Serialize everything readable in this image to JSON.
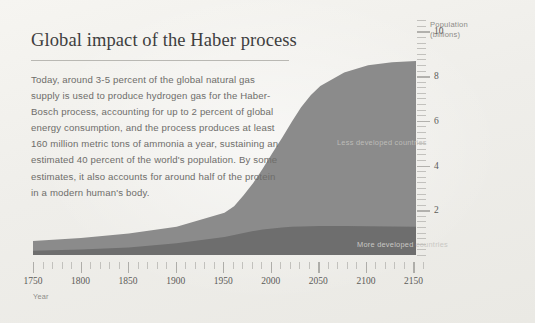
{
  "page": {
    "background": "#f2f1ed",
    "title": "Global impact of the Haber process",
    "body": "Today, around 3-5 percent of the global natural gas supply is used to produce hydrogen gas for the Haber-Bosch process, accounting for up to 2 percent of global energy consumption, and the process produces at least 160 million metric tons of ammonia a year, sustaining an estimated 40 percent of the world's population. By some estimates, it also accounts for around half of the protein in a modern human's body."
  },
  "axes": {
    "y_caption_line1": "Population",
    "y_caption_line2": "(billions)",
    "x_caption": "Year",
    "y_major_labels": [
      "10",
      "8",
      "6",
      "4",
      "2"
    ],
    "x_major_labels": [
      "1750",
      "1800",
      "1850",
      "1900",
      "1950",
      "2000",
      "2050",
      "2100",
      "2150"
    ]
  },
  "series_labels": {
    "less_developed": "Less developed countries",
    "more_developed": "More developed countries"
  },
  "colors": {
    "background": "#f2f1ed",
    "less_developed": "#8b8b8b",
    "more_developed": "#6e6e6e",
    "title_text": "#3e3e3e",
    "body_text": "#6e6d6a",
    "axis_text": "#5c5b58",
    "tick": "#c2c1bd"
  },
  "chart_data": {
    "type": "area",
    "title": "Global impact of the Haber process",
    "xlabel": "Year",
    "ylabel": "Population (billions)",
    "xlim": [
      1750,
      2160
    ],
    "ylim": [
      0,
      10.6
    ],
    "grid": false,
    "legend": "inline-labels",
    "stacked": true,
    "x": [
      1750,
      1800,
      1850,
      1900,
      1950,
      1960,
      1970,
      1980,
      1990,
      2000,
      2010,
      2020,
      2030,
      2040,
      2050,
      2075,
      2100,
      2125,
      2150
    ],
    "series": [
      {
        "name": "More developed countries",
        "values": [
          0.19,
          0.24,
          0.33,
          0.54,
          0.81,
          0.91,
          1.0,
          1.08,
          1.15,
          1.19,
          1.24,
          1.27,
          1.29,
          1.3,
          1.31,
          1.31,
          1.3,
          1.29,
          1.28
        ]
      },
      {
        "name": "Less developed countries",
        "values": [
          0.6,
          0.74,
          0.93,
          1.12,
          1.72,
          2.09,
          2.7,
          3.36,
          4.15,
          4.95,
          5.72,
          6.52,
          7.28,
          7.91,
          8.4,
          9.05,
          9.35,
          9.48,
          9.52
        ]
      }
    ],
    "totals": [
      0.79,
      0.98,
      1.26,
      1.66,
      2.53,
      3.0,
      3.7,
      4.44,
      5.3,
      6.14,
      6.96,
      7.79,
      8.57,
      9.21,
      9.71,
      10.36,
      10.65,
      10.77,
      10.8
    ]
  }
}
